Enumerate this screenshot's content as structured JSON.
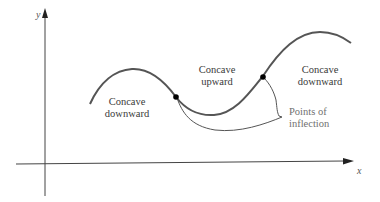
{
  "figure": {
    "axes": {
      "x_label": "x",
      "y_label": "y"
    },
    "regions": [
      {
        "line1": "Concave",
        "line2": "downward"
      },
      {
        "line1": "Concave",
        "line2": "upward"
      },
      {
        "line1": "Concave",
        "line2": "downward"
      }
    ],
    "callout": {
      "line1": "Points of",
      "line2": "inflection"
    },
    "colors": {
      "curve": "#555555",
      "axes": "#444444",
      "point": "#000000",
      "callout_text": "#707070"
    }
  }
}
